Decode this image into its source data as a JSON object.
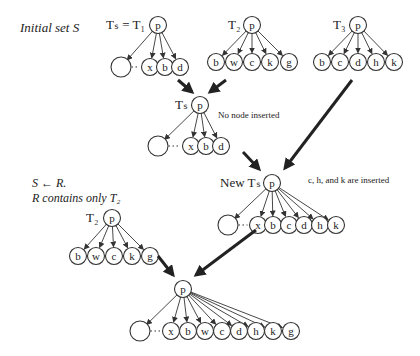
{
  "annotations": {
    "initial_set": "Initial set S",
    "assign": "S ← R.",
    "r_contains": "R contains only T₂",
    "no_node_inserted": "No node inserted",
    "inserted": "c, h, and k are inserted"
  },
  "trees": [
    {
      "id": "T1",
      "label": "Tₛ = T₁",
      "root": "p",
      "children": [
        "",
        "x",
        "b",
        "d"
      ],
      "ellipsis_after_first": true
    },
    {
      "id": "T2",
      "label": "T₂",
      "root": "p",
      "children": [
        "b",
        "w",
        "c",
        "k",
        "g"
      ]
    },
    {
      "id": "T3",
      "label": "T₃",
      "root": "p",
      "children": [
        "b",
        "c",
        "d",
        "h",
        "k"
      ]
    },
    {
      "id": "Ts",
      "label": "Tₛ",
      "root": "p",
      "children": [
        "",
        "x",
        "b",
        "d"
      ],
      "ellipsis_after_first": true
    },
    {
      "id": "NewTs",
      "label": "New Tₛ",
      "root": "p",
      "children": [
        "",
        "x",
        "b",
        "c",
        "d",
        "h",
        "k"
      ],
      "ellipsis_after_first": true
    },
    {
      "id": "T2copy",
      "label": "T₂",
      "root": "p",
      "children": [
        "b",
        "w",
        "c",
        "k",
        "g"
      ]
    },
    {
      "id": "Final",
      "label": "",
      "root": "p",
      "children": [
        "",
        "x",
        "b",
        "w",
        "c",
        "d",
        "h",
        "k",
        "g"
      ],
      "ellipsis_after_first": true
    }
  ],
  "flows": [
    {
      "from": "T1",
      "to": "Ts"
    },
    {
      "from": "T2",
      "to": "Ts"
    },
    {
      "from": "Ts",
      "to": "NewTs"
    },
    {
      "from": "T3",
      "to": "NewTs"
    },
    {
      "from": "T2copy",
      "to": "Final"
    },
    {
      "from": "NewTs",
      "to": "Final"
    }
  ]
}
